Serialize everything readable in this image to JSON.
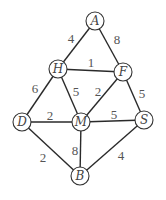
{
  "graph": {
    "type": "weighted-undirected-graph",
    "colors": {
      "edge": "#2a2a2a",
      "node_stroke": "#333333",
      "text": "#555555",
      "background": "#ffffff"
    },
    "nodes": [
      {
        "id": "A",
        "label": "A",
        "x": 95,
        "y": 21
      },
      {
        "id": "H",
        "label": "H",
        "x": 58,
        "y": 69
      },
      {
        "id": "F",
        "label": "F",
        "x": 123,
        "y": 72
      },
      {
        "id": "D",
        "label": "D",
        "x": 22,
        "y": 122
      },
      {
        "id": "M",
        "label": "M",
        "x": 81,
        "y": 122
      },
      {
        "id": "S",
        "label": "S",
        "x": 144,
        "y": 120
      },
      {
        "id": "B",
        "label": "B",
        "x": 80,
        "y": 176
      }
    ],
    "edges": [
      {
        "from": "A",
        "to": "H",
        "weight": "4",
        "lx": 71,
        "ly": 43
      },
      {
        "from": "A",
        "to": "F",
        "weight": "8",
        "lx": 117,
        "ly": 44
      },
      {
        "from": "H",
        "to": "F",
        "weight": "1",
        "lx": 91,
        "ly": 67
      },
      {
        "from": "H",
        "to": "D",
        "weight": "6",
        "lx": 35,
        "ly": 93
      },
      {
        "from": "H",
        "to": "M",
        "weight": "5",
        "lx": 76,
        "ly": 96
      },
      {
        "from": "F",
        "to": "M",
        "weight": "2",
        "lx": 98,
        "ly": 96
      },
      {
        "from": "F",
        "to": "S",
        "weight": "5",
        "lx": 142,
        "ly": 98
      },
      {
        "from": "D",
        "to": "M",
        "weight": "2",
        "lx": 50,
        "ly": 120
      },
      {
        "from": "M",
        "to": "S",
        "weight": "5",
        "lx": 114,
        "ly": 119
      },
      {
        "from": "D",
        "to": "B",
        "weight": "2",
        "lx": 43,
        "ly": 162
      },
      {
        "from": "M",
        "to": "B",
        "weight": "8",
        "lx": 75,
        "ly": 155
      },
      {
        "from": "S",
        "to": "B",
        "weight": "4",
        "lx": 121,
        "ly": 160
      }
    ]
  }
}
